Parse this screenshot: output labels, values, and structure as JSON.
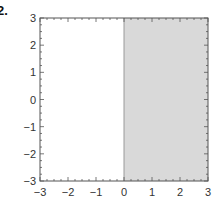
{
  "figure_label": "2.",
  "colors": {
    "frame": "#555555",
    "shade": "#d9d9d9",
    "tick_text": "#333333",
    "background": "#ffffff"
  },
  "chart_data": {
    "type": "area",
    "title": "",
    "xlabel": "",
    "ylabel": "",
    "xlim": [
      -3,
      3
    ],
    "ylim": [
      -3,
      3
    ],
    "grid": false,
    "legend": null,
    "x_ticks": [
      -3,
      -2,
      -1,
      0,
      1,
      2,
      3
    ],
    "y_ticks": [
      -3,
      -2,
      -1,
      0,
      1,
      2,
      3
    ],
    "x_tick_labels": [
      "−3",
      "−2",
      "−1",
      "0",
      "1",
      "2",
      "3"
    ],
    "y_tick_labels": [
      "−3",
      "−2",
      "−1",
      "0",
      "1",
      "2",
      "3"
    ],
    "minor_tick_step": 0.25,
    "shaded_regions": [
      {
        "description": "x >= 0",
        "x_range": [
          0,
          3
        ],
        "y_range": [
          -3,
          3
        ],
        "fill": "#d9d9d9"
      }
    ],
    "boundary_lines": [
      {
        "type": "vertical",
        "x": 0,
        "style": "solid"
      }
    ]
  }
}
